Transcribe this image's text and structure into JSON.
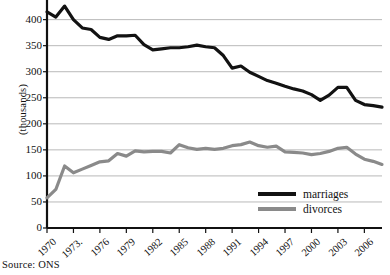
{
  "chart_data": {
    "type": "line",
    "title": "",
    "xlabel": "",
    "ylabel": "(thousands)",
    "source": "Source: ONS",
    "grid": true,
    "legend_position": "bottom-right",
    "xlim": [
      1970,
      2008
    ],
    "ylim": [
      0,
      430
    ],
    "yticks": [
      0,
      50,
      100,
      150,
      200,
      250,
      300,
      350,
      400
    ],
    "xticks": [
      1970,
      1973,
      1976,
      1979,
      1982,
      1985,
      1988,
      1991,
      1994,
      1997,
      2000,
      2003,
      2006
    ],
    "x": [
      1970,
      1971,
      1972,
      1973,
      1974,
      1975,
      1976,
      1977,
      1978,
      1979,
      1980,
      1981,
      1982,
      1983,
      1984,
      1985,
      1986,
      1987,
      1988,
      1989,
      1990,
      1991,
      1992,
      1993,
      1994,
      1995,
      1996,
      1997,
      1998,
      1999,
      2000,
      2001,
      2002,
      2003,
      2004,
      2005,
      2006,
      2007,
      2008
    ],
    "series": [
      {
        "name": "marriages",
        "color": "#121212",
        "width": 3.2,
        "values": [
          415,
          405,
          426,
          400,
          384,
          381,
          366,
          362,
          369,
          369,
          370,
          352,
          342,
          344,
          346,
          346,
          348,
          351,
          348,
          346,
          331,
          307,
          311,
          299,
          291,
          283,
          278,
          272,
          267,
          263,
          256,
          245,
          255,
          270,
          270,
          245,
          237,
          235,
          232
        ]
      },
      {
        "name": "divorces",
        "color": "#8a8a8a",
        "width": 3.2,
        "values": [
          58,
          74,
          119,
          106,
          113,
          120,
          127,
          129,
          143,
          138,
          148,
          146,
          147,
          147,
          144,
          160,
          154,
          151,
          153,
          151,
          153,
          158,
          160,
          165,
          158,
          155,
          157,
          146,
          145,
          144,
          141,
          143,
          147,
          153,
          155,
          142,
          132,
          128,
          122
        ]
      }
    ]
  },
  "axis": {
    "y_title": "(thousands)",
    "y_tick_labels": [
      "400",
      "350",
      "300",
      "250",
      "200",
      "150",
      "100",
      "50",
      "0"
    ],
    "x_tick_labels": [
      "1970",
      "1973.",
      "1976",
      "1979",
      "1982",
      "1985",
      "1988",
      "1991",
      "1994",
      "1997",
      "2000",
      "2003",
      "2006"
    ]
  },
  "legend": {
    "items": [
      {
        "label": "marriages",
        "color": "#121212"
      },
      {
        "label": "divorces",
        "color": "#8a8a8a"
      }
    ]
  },
  "footer": {
    "source": "Source: ONS"
  }
}
